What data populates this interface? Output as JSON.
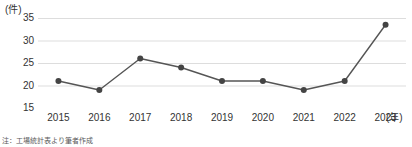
{
  "chart_data": {
    "type": "line",
    "title": "",
    "xlabel": "年",
    "ylabel": "件",
    "y_unit_label": "(件)",
    "x_unit_label": "(年)",
    "categories": [
      "2015",
      "2016",
      "2017",
      "2018",
      "2019",
      "2020",
      "2021",
      "2022",
      "2023"
    ],
    "values": [
      21,
      19,
      26,
      24,
      21,
      21,
      19,
      21,
      33.5
    ],
    "series": [
      {
        "name": "件数",
        "values": [
          21,
          19,
          26,
          24,
          21,
          21,
          19,
          21,
          33.5
        ]
      }
    ],
    "ylim": [
      15,
      35
    ],
    "yticks": [
      15,
      20,
      25,
      30,
      35
    ],
    "ytick_labels": [
      "15",
      "20",
      "25",
      "30",
      "35"
    ],
    "grid": true,
    "legend": "none",
    "marker": "circle",
    "line_color": "#555555",
    "marker_color": "#444444",
    "grid_color": "#d9d9d9",
    "axis_color": "#bcbcbc"
  },
  "footnote": {
    "text": "注：工場統計表より筆者作成"
  }
}
